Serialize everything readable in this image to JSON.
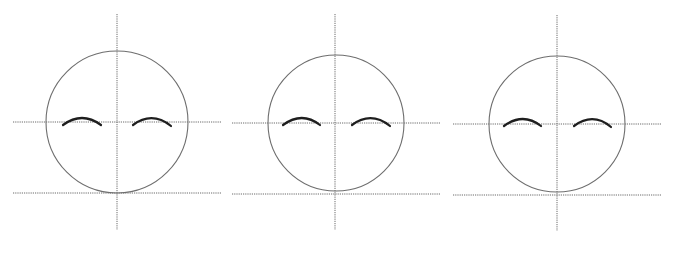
{
  "diagram": {
    "title": "",
    "colors": {
      "background": "#ffffff",
      "guide_line": "#6a6a6a",
      "head_outline": "#6e6e6e",
      "brow_stroke": "#1e1e1e"
    },
    "panels": [
      {
        "id": "face-1",
        "center": [
          117,
          122
        ],
        "radius": 71,
        "vertical_guide": {
          "x": 117,
          "y1": 14,
          "y2": 230
        },
        "eye_line": {
          "y": 122,
          "x1": 13,
          "x2": 221
        },
        "chin_line": {
          "y": 193,
          "x1": 13,
          "x2": 221
        },
        "left_brow": "M63 125 Q82 111 101 125",
        "right_brow": "M133 125 Q152 111 171 126"
      },
      {
        "id": "face-2",
        "center": [
          336,
          123
        ],
        "radius": 68,
        "vertical_guide": {
          "x": 335,
          "y1": 14,
          "y2": 230
        },
        "eye_line": {
          "y": 123,
          "x1": 232,
          "x2": 441
        },
        "chin_line": {
          "y": 194,
          "x1": 232,
          "x2": 441
        },
        "left_brow": "M283 125 Q302 111 320 125",
        "right_brow": "M352 125 Q371 111 390 126"
      },
      {
        "id": "face-3",
        "center": [
          557,
          124
        ],
        "radius": 68,
        "vertical_guide": {
          "x": 557,
          "y1": 15,
          "y2": 231
        },
        "eye_line": {
          "y": 124,
          "x1": 453,
          "x2": 661
        },
        "chin_line": {
          "y": 195,
          "x1": 453,
          "x2": 661
        },
        "left_brow": "M504 126 Q523 112 541 126",
        "right_brow": "M574 126 Q593 112 611 127"
      }
    ]
  }
}
